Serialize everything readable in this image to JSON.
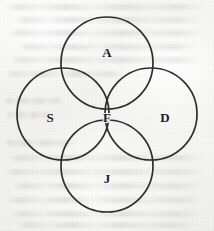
{
  "figure": {
    "background_color": "#f4f4f2",
    "stroke_color": "#2e2e30",
    "label_color": "#1d1d1f",
    "canvas": {
      "width": 214,
      "height": 231
    },
    "circle_radius": 46,
    "stroke_width": 1.7
  },
  "circles": [
    {
      "id": "top",
      "label": "A",
      "cx": 107,
      "cy": 63,
      "r": 46,
      "label_x": 107,
      "label_y": 52
    },
    {
      "id": "left",
      "label": "S",
      "cx": 63,
      "cy": 114,
      "r": 46,
      "label_x": 50,
      "label_y": 117
    },
    {
      "id": "right",
      "label": "D",
      "cx": 151,
      "cy": 114,
      "r": 46,
      "label_x": 165,
      "label_y": 117
    },
    {
      "id": "bottom",
      "label": "J",
      "cx": 107,
      "cy": 166,
      "r": 46,
      "label_x": 107,
      "label_y": 178
    }
  ],
  "center_region": {
    "id": "intersection",
    "label": "F",
    "label_x": 107,
    "label_y": 117
  },
  "bleed_through_lines": [
    {
      "top": 4,
      "left": 6,
      "width": 200
    },
    {
      "top": 17,
      "left": 14,
      "width": 188
    },
    {
      "top": 30,
      "left": 8,
      "width": 196
    },
    {
      "top": 44,
      "left": 18,
      "width": 180
    },
    {
      "top": 57,
      "left": 10,
      "width": 192
    },
    {
      "top": 71,
      "left": 6,
      "width": 120
    },
    {
      "top": 98,
      "left": 4,
      "width": 60
    },
    {
      "top": 112,
      "left": 6,
      "width": 48
    },
    {
      "top": 140,
      "left": 5,
      "width": 70
    },
    {
      "top": 155,
      "left": 8,
      "width": 196
    },
    {
      "top": 169,
      "left": 4,
      "width": 200
    },
    {
      "top": 183,
      "left": 12,
      "width": 190
    },
    {
      "top": 197,
      "left": 6,
      "width": 198
    },
    {
      "top": 211,
      "left": 10,
      "width": 192
    },
    {
      "top": 222,
      "left": 16,
      "width": 180
    }
  ]
}
